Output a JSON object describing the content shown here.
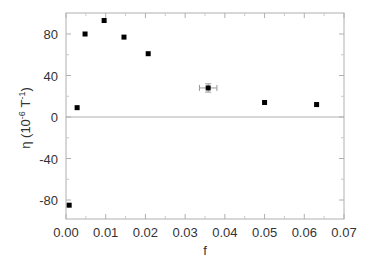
{
  "chart_data": {
    "type": "scatter",
    "title": "",
    "xlabel": "f",
    "ylabel": "η (10 -6 T -1)",
    "ylabel_parts": {
      "main": "η (10",
      "sup1": "-6",
      "mid": " T",
      "sup2": "-1",
      "end": ")"
    },
    "xlim": [
      0.0,
      0.07
    ],
    "ylim": [
      -92,
      98
    ],
    "x_ticks": [
      "0.00",
      "0.01",
      "0.02",
      "0.03",
      "0.04",
      "0.05",
      "0.06",
      "0.07"
    ],
    "y_ticks": [
      "80",
      "40",
      "0",
      "-40",
      "-80"
    ],
    "grid": false,
    "zero_line": true,
    "legend": null,
    "series": [
      {
        "name": "data",
        "marker": "square",
        "color": "#000000",
        "x": [
          0.0008,
          0.0028,
          0.0048,
          0.0096,
          0.0146,
          0.0207,
          0.0358,
          0.05,
          0.0631
        ],
        "y": [
          -85,
          9,
          80,
          93,
          77,
          61,
          28,
          14,
          12
        ],
        "xerr": [
          0,
          0,
          0,
          0,
          0,
          0,
          0.0022,
          0,
          0
        ],
        "yerr": [
          0,
          0,
          0,
          0,
          0,
          0,
          4,
          0,
          0
        ]
      }
    ]
  }
}
